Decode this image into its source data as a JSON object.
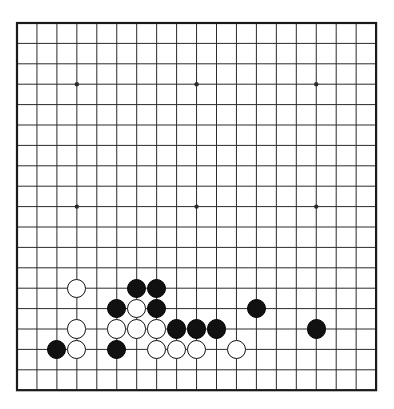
{
  "board": {
    "title": "Go board position",
    "size": 19,
    "origin_x": 17,
    "origin_y": 23,
    "step_x": 19.95,
    "step_y": 20.4,
    "stone_radius": 9.6,
    "line_color": "#2b2b2b",
    "border_color": "#1a1a1a",
    "background_color": "#ffffff",
    "black_color": "#111111",
    "white_color": "#ffffff",
    "line_width": 1,
    "border_width": 2.2,
    "star_point_radius": 2.2,
    "star_points": [
      {
        "col": 3,
        "row": 3
      },
      {
        "col": 9,
        "row": 3
      },
      {
        "col": 15,
        "row": 3
      },
      {
        "col": 3,
        "row": 9
      },
      {
        "col": 9,
        "row": 9
      },
      {
        "col": 15,
        "row": 9
      },
      {
        "col": 3,
        "row": 15
      },
      {
        "col": 9,
        "row": 15
      },
      {
        "col": 15,
        "row": 15
      }
    ],
    "visible_star_points": [
      {
        "col": 3,
        "row": 3
      },
      {
        "col": 9,
        "row": 3
      },
      {
        "col": 15,
        "row": 3
      },
      {
        "col": 3,
        "row": 9
      },
      {
        "col": 9,
        "row": 9
      },
      {
        "col": 15,
        "row": 9
      }
    ],
    "stones": [
      {
        "col": 3,
        "row": 13,
        "color": "white"
      },
      {
        "col": 6,
        "row": 13,
        "color": "black"
      },
      {
        "col": 7,
        "row": 13,
        "color": "black"
      },
      {
        "col": 5,
        "row": 14,
        "color": "black"
      },
      {
        "col": 6,
        "row": 14,
        "color": "white"
      },
      {
        "col": 7,
        "row": 14,
        "color": "black"
      },
      {
        "col": 12,
        "row": 14,
        "color": "black"
      },
      {
        "col": 3,
        "row": 15,
        "color": "white"
      },
      {
        "col": 5,
        "row": 15,
        "color": "white"
      },
      {
        "col": 6,
        "row": 15,
        "color": "white"
      },
      {
        "col": 7,
        "row": 15,
        "color": "white"
      },
      {
        "col": 8,
        "row": 15,
        "color": "black"
      },
      {
        "col": 9,
        "row": 15,
        "color": "black"
      },
      {
        "col": 10,
        "row": 15,
        "color": "black"
      },
      {
        "col": 15,
        "row": 15,
        "color": "black"
      },
      {
        "col": 2,
        "row": 16,
        "color": "black"
      },
      {
        "col": 3,
        "row": 16,
        "color": "white"
      },
      {
        "col": 5,
        "row": 16,
        "color": "black"
      },
      {
        "col": 7,
        "row": 16,
        "color": "white"
      },
      {
        "col": 8,
        "row": 16,
        "color": "white"
      },
      {
        "col": 9,
        "row": 16,
        "color": "white"
      },
      {
        "col": 11,
        "row": 16,
        "color": "white"
      }
    ],
    "counts": {
      "black_stones": 12,
      "white_stones": 10,
      "total_stones": 22
    }
  }
}
